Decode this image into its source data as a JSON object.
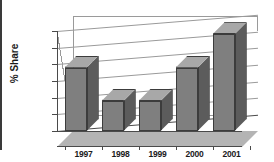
{
  "chart_data": {
    "type": "bar",
    "title": "",
    "subtitle": "",
    "xlabel": "",
    "ylabel": "% Share",
    "categories": [
      "1997",
      "1998",
      "1999",
      "2000",
      "2001"
    ],
    "values": [
      59.8,
      57.8,
      57.8,
      59.8,
      61.8
    ],
    "value_labels": [
      "",
      "",
      "",
      "",
      ""
    ],
    "ylim": [
      56,
      62
    ],
    "y_ticks": [
      56,
      57,
      58,
      59,
      60,
      61,
      62
    ],
    "y_tick_labels": [
      "56%",
      "57%",
      "58%",
      "59%",
      "60%",
      "61%",
      "62%"
    ],
    "grid": true,
    "legend": false,
    "legend_position": "none",
    "series": [
      {
        "name": "% Share",
        "values": [
          59.8,
          57.8,
          57.8,
          59.8,
          61.8
        ]
      }
    ],
    "style": {
      "three_d": true,
      "bar_front_color": "#7f7f7f",
      "bar_side_color": "#5c5c5c",
      "bar_top_color": "#a8a8a8",
      "bar_edge_color": "#3c3c3c",
      "gridline_color": "#9a9a9a",
      "axis_color": "#4a4a4a",
      "floor_color": "#b4b4b4",
      "background_color": "#ffffff",
      "text_color": "#1a1a1a"
    }
  }
}
